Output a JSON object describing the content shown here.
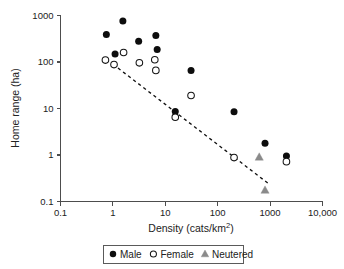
{
  "chart_data": {
    "type": "scatter",
    "title": "",
    "xlabel": "Density (cats/km2)",
    "xlabel_base": "Density (cats/km",
    "xlabel_exponent": "2",
    "xlabel_close": ")",
    "ylabel": "Home range (ha)",
    "xscale": "log",
    "yscale": "log",
    "xlim": [
      0.1,
      10000
    ],
    "ylim": [
      0.1,
      1000
    ],
    "grid": false,
    "xticks": [
      0.1,
      1,
      10,
      100,
      1000,
      10000
    ],
    "xtick_labels": [
      "0.1",
      "1",
      "10",
      "100",
      "1000",
      "10,000"
    ],
    "yticks": [
      0.1,
      1,
      10,
      100,
      1000
    ],
    "ytick_labels": [
      "0.1",
      "1",
      "10",
      "100",
      "1000"
    ],
    "legend_position": "below-axes",
    "series": [
      {
        "name": "Male",
        "marker": "filled-circle",
        "color": "#0d0d0d",
        "points": [
          [
            0.75,
            390
          ],
          [
            1.1,
            148
          ],
          [
            1.55,
            760
          ],
          [
            3.1,
            280
          ],
          [
            6.6,
            370
          ],
          [
            7.0,
            185
          ],
          [
            15.5,
            8.6
          ],
          [
            31,
            66
          ],
          [
            205,
            8.5
          ],
          [
            800,
            1.8
          ],
          [
            2050,
            0.95
          ]
        ]
      },
      {
        "name": "Female",
        "marker": "open-circle",
        "color": "#ffffff",
        "points": [
          [
            0.72,
            110
          ],
          [
            1.05,
            88
          ],
          [
            1.6,
            160
          ],
          [
            3.2,
            96
          ],
          [
            6.3,
            112
          ],
          [
            6.6,
            66
          ],
          [
            15.5,
            6.5
          ],
          [
            31,
            19
          ],
          [
            205,
            0.88
          ],
          [
            2050,
            0.72
          ]
        ]
      },
      {
        "name": "Neutered",
        "marker": "filled-triangle",
        "color": "#8a8a8a",
        "points": [
          [
            620,
            0.9
          ],
          [
            800,
            0.175
          ]
        ]
      }
    ],
    "trendline": {
      "style": "dashed",
      "color": "#111111",
      "start": [
        1.0,
        90
      ],
      "end": [
        900,
        0.25
      ]
    },
    "annotations": []
  },
  "legend": {
    "items": [
      {
        "marker": "filled-circle",
        "label": "Male"
      },
      {
        "marker": "open-circle",
        "label": "Female"
      },
      {
        "marker": "filled-triangle",
        "label": "Neutered"
      }
    ]
  }
}
